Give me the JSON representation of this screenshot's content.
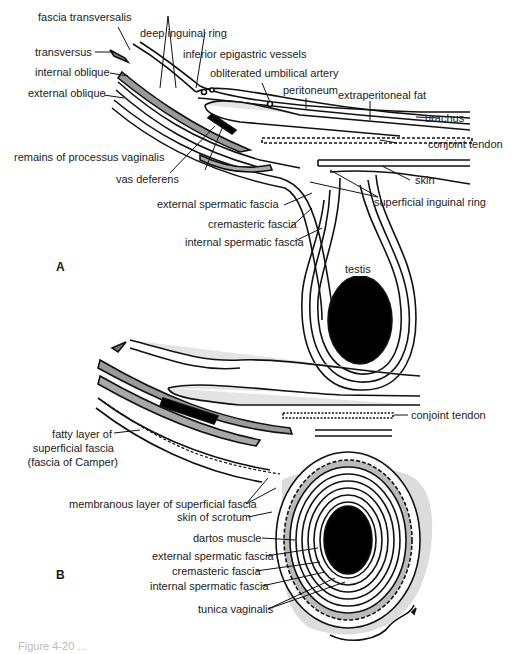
{
  "figure": {
    "panel_a": {
      "letter": "A",
      "labels": {
        "fascia_transversalis": "fascia transversalis",
        "deep_inguinal_ring": "deep inguinal ring",
        "transversus": "transversus",
        "inferior_epigastric_vessels": "inferior epigastric vessels",
        "internal_oblique": "internal oblique",
        "obliterated_umbilical_artery": "obliterated umbilical artery",
        "external_oblique": "external oblique",
        "peritoneum": "peritoneum",
        "extraperitoneal_fat": "extraperitoneal fat",
        "urachus": "urachus",
        "conjoint_tendon": "conjoint tendon",
        "remains_of_processus_vaginalis": "remains of processus vaginalis",
        "skin": "skin",
        "vas_deferens": "vas deferens",
        "superficial_inguinal_ring": "superficial inguinal ring",
        "external_spermatic_fascia": "external spermatic fascia",
        "cremasteric_fascia": "cremasteric fascia",
        "internal_spermatic_fascia": "internal spermatic fascia",
        "testis": "testis"
      }
    },
    "panel_b": {
      "letter": "B",
      "labels": {
        "conjoint_tendon": "conjoint tendon",
        "fatty_layer_line1": "fatty layer of",
        "fatty_layer_line2": "superficial fascia",
        "fatty_layer_line3": "(fascia of Camper)",
        "membranous_layer": "membranous layer of superficial fascia",
        "skin_of_scrotum": "skin of scrotum",
        "dartos_muscle": "dartos muscle",
        "external_spermatic_fascia": "external spermatic fascia",
        "cremasteric_fascia": "cremasteric fascia",
        "internal_spermatic_fascia": "internal spermatic fascia",
        "tunica_vaginalis": "tunica vaginalis"
      }
    },
    "caption": "Figure 4-20 ...",
    "colors": {
      "line": "#111111",
      "gray_layer": "#9a9a9a",
      "light_fill": "#e4e4e4",
      "scrotum_fill": "#dcdcdc",
      "testis": "#000000"
    }
  }
}
